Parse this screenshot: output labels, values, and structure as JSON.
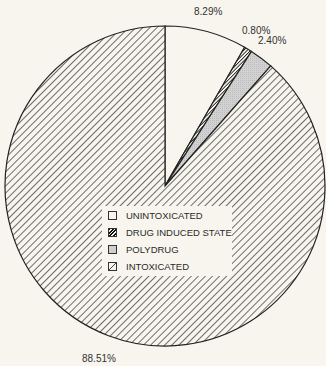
{
  "chart_data": {
    "type": "pie",
    "title": "",
    "slices": [
      {
        "label": "UNINTOXICATED",
        "value": 8.29,
        "value_label": "8.29%",
        "fill": "white"
      },
      {
        "label": "DRUG INDUCED STATE",
        "value": 0.8,
        "value_label": "0.80%",
        "fill": "dense-dark-hatch"
      },
      {
        "label": "POLYDRUG",
        "value": 2.4,
        "value_label": "2.40%",
        "fill": "light-gray-dotted"
      },
      {
        "label": "INTOXICATED",
        "value": 88.51,
        "value_label": "88.51%",
        "fill": "diagonal-hatch"
      }
    ],
    "start_angle": "12 o'clock, clockwise",
    "legend_position": "inside pie, lower-center"
  },
  "labels": {
    "unintoxicated": "8.29%",
    "drug_induced": "0.80%",
    "polydrug": "2.40%",
    "intoxicated": "88.51%"
  },
  "legend": {
    "items": [
      {
        "label": "UNINTOXICATED"
      },
      {
        "label": "DRUG INDUCED STATE"
      },
      {
        "label": "POLYDRUG"
      },
      {
        "label": "INTOXICATED"
      }
    ]
  },
  "colors": {
    "background": "#f7f5ee",
    "outline": "#222222",
    "polydrug": "#cfcfcf",
    "hatch": "#555555"
  }
}
